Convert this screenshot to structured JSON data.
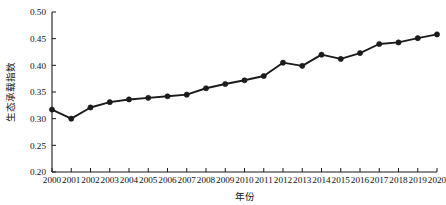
{
  "chart_data": {
    "type": "line",
    "title": "",
    "subtitle": "",
    "xlabel": "年份",
    "ylabel": "生态承载指数",
    "categories": [
      "2000",
      "2001",
      "2002",
      "2003",
      "2004",
      "2005",
      "2006",
      "2007",
      "2008",
      "2009",
      "2010",
      "2011",
      "2012",
      "2013",
      "2014",
      "2015",
      "2016",
      "2017",
      "2018",
      "2019",
      "2020"
    ],
    "series": [
      {
        "name": "生态承载指数",
        "values": [
          0.317,
          0.3,
          0.321,
          0.331,
          0.336,
          0.339,
          0.342,
          0.345,
          0.357,
          0.365,
          0.372,
          0.38,
          0.405,
          0.399,
          0.42,
          0.412,
          0.423,
          0.44,
          0.443,
          0.451,
          0.458
        ]
      }
    ],
    "ylim": [
      0.2,
      0.5
    ],
    "yticks": [
      0.2,
      0.25,
      0.3,
      0.35,
      0.4,
      0.45,
      0.5
    ],
    "ytick_labels": [
      "0.20",
      "0.25",
      "0.30",
      "0.35",
      "0.40",
      "0.45",
      "0.50"
    ],
    "grid": false,
    "legend": false,
    "legend_position": "none",
    "marker": "circle",
    "line_color": "#1b1b1b",
    "marker_color": "#1b1b1b",
    "background_color": "#ffffff",
    "axis_color": "#1a1a1a"
  }
}
